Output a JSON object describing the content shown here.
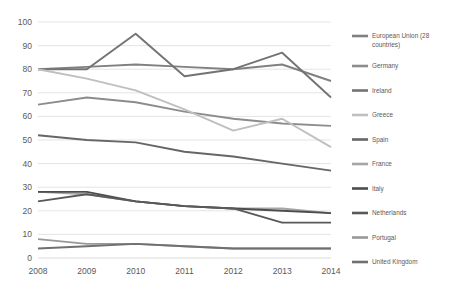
{
  "chart_data": {
    "type": "line",
    "title": "",
    "xlabel": "",
    "ylabel": "",
    "categories": [
      "2008",
      "2009",
      "2010",
      "2011",
      "2012",
      "2013",
      "2014"
    ],
    "ylim": [
      0,
      100
    ],
    "yticks": [
      0,
      10,
      20,
      30,
      40,
      50,
      60,
      70,
      80,
      90,
      100
    ],
    "grid": true,
    "legend_position": "right",
    "series": [
      {
        "name": "European Union (28 countries)",
        "color": "#808080",
        "values": [
          80,
          81,
          82,
          81,
          80,
          82,
          75
        ]
      },
      {
        "name": "Germany",
        "color": "#8c8c8c",
        "values": [
          65,
          68,
          66,
          62,
          59,
          57,
          56
        ]
      },
      {
        "name": "Ireland",
        "color": "#737373",
        "values": [
          80,
          80,
          95,
          77,
          80,
          87,
          68
        ]
      },
      {
        "name": "Greece",
        "color": "#bfbfbf",
        "values": [
          80,
          76,
          71,
          63,
          54,
          59,
          47
        ]
      },
      {
        "name": "Spain",
        "color": "#666666",
        "values": [
          52,
          50,
          49,
          45,
          43,
          40,
          37
        ]
      },
      {
        "name": "France",
        "color": "#a6a6a6",
        "values": [
          28,
          27,
          24,
          22,
          21,
          21,
          19
        ]
      },
      {
        "name": "Italy",
        "color": "#4d4d4d",
        "values": [
          28,
          28,
          24,
          22,
          21,
          20,
          19
        ]
      },
      {
        "name": "Netherlands",
        "color": "#595959",
        "values": [
          24,
          27,
          24,
          22,
          21,
          15,
          15
        ]
      },
      {
        "name": "Portugal",
        "color": "#999999",
        "values": [
          8,
          6,
          6,
          5,
          4,
          4,
          4
        ]
      },
      {
        "name": "United Kingdom",
        "color": "#707070",
        "values": [
          4,
          5,
          6,
          5,
          4,
          4,
          4
        ]
      }
    ]
  }
}
